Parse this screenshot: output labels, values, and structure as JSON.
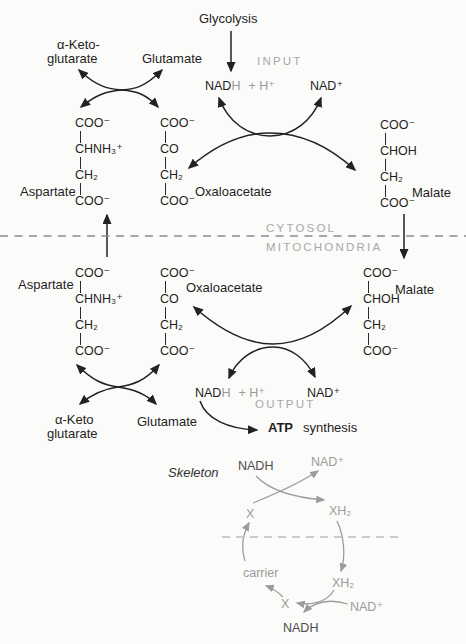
{
  "cytosol": {
    "glycolysis_label": "Glycolysis",
    "input_label": "INPUT",
    "nadh_prefix": "NAD",
    "nadh_h": "H",
    "plus_h": "+ H⁺",
    "nad_plus": "NAD⁺",
    "alpha_keto_line1": "α-Keto-",
    "alpha_keto_line2": "glutarate",
    "glutamate_label": "Glutamate",
    "aspartate": {
      "label": "Aspartate",
      "formula": [
        "COO⁻",
        "CHNH₃⁺",
        "CH₂",
        "COO⁻"
      ]
    },
    "oxaloacetate": {
      "label": "Oxaloacetate",
      "formula": [
        "COO⁻",
        "CO",
        "CH₂",
        "COO⁻"
      ]
    },
    "malate": {
      "label": "Malate",
      "formula": [
        "COO⁻",
        "CHOH",
        "CH₂",
        "COO⁻"
      ]
    }
  },
  "membrane": {
    "cytosol_label": "CYTOSOL",
    "mitochondria_label": "MITOCHONDRIA"
  },
  "mitochondria": {
    "aspartate": {
      "label": "Aspartate",
      "formula": [
        "COO⁻",
        "CHNH₃⁺",
        "CH₂",
        "COO⁻"
      ]
    },
    "oxaloacetate": {
      "label": "Oxaloacetate",
      "formula": [
        "COO⁻",
        "CO",
        "CH₂",
        "COO⁻"
      ]
    },
    "malate": {
      "label": "Malate",
      "formula": [
        "COO⁻",
        "CHOH",
        "CH₂",
        "COO⁻"
      ]
    },
    "alpha_keto_line1": "α-Keto",
    "alpha_keto_line2": "glutarate",
    "glutamate_label": "Glutamate",
    "nadh_prefix": "NAD",
    "nadh_h": "H",
    "plus_h": "+ H⁺",
    "nad_plus": "NAD⁺",
    "output_label": "OUTPUT",
    "atp_label": "ATP",
    "synthesis_label": "synthesis"
  },
  "skeleton": {
    "title": "Skeleton",
    "nadh_top": "NADH",
    "nad_top": "NAD⁺",
    "x_top": "X",
    "xh2_top": "XH₂",
    "carrier_label": "carrier",
    "xh2_bottom": "XH₂",
    "x_bottom": "X",
    "nad_bottom": "NAD⁺",
    "nadh_bottom": "NADH"
  },
  "palette": {
    "ink": "#1f1f1f",
    "gray_label": "#a8a8a8",
    "skeleton_gray": "#9c9c9c",
    "skeleton_dark": "#4d4d4d",
    "membrane_dash": "#8c8c8c",
    "background": "#fbfbf9"
  }
}
